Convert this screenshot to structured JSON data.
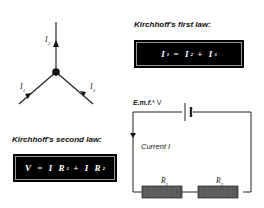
{
  "junction": {
    "labels": {
      "i1": {
        "base": "I",
        "sub": "1"
      },
      "i2": {
        "base": "I",
        "sub": "2"
      },
      "i3": {
        "base": "I",
        "sub": "3"
      }
    }
  },
  "first_law": {
    "title": "Kirchhoff's first law:",
    "equation": {
      "lhs": "I",
      "lhs_sub": "1",
      "eq": "=",
      "t1": "I",
      "t1_sub": "2",
      "plus": "+",
      "t2": "I",
      "t2_sub": "3"
    }
  },
  "second_law": {
    "title": "Kirchhoff's second law:",
    "equation": {
      "lhs": "V",
      "eq": "=",
      "t1": "I R",
      "t1_sub": "1",
      "plus": "+",
      "t2": "I R",
      "t2_sub": "2"
    }
  },
  "circuit": {
    "emf_label": "E.m.f.",
    "emf_symbol": "* V",
    "current_label": "Current I",
    "resistors": [
      {
        "base": "R",
        "sub": "1"
      },
      {
        "base": "R",
        "sub": "2"
      }
    ]
  },
  "colors": {
    "box_bg": "#000000",
    "resistor": "#555555",
    "wire": "#222222"
  }
}
